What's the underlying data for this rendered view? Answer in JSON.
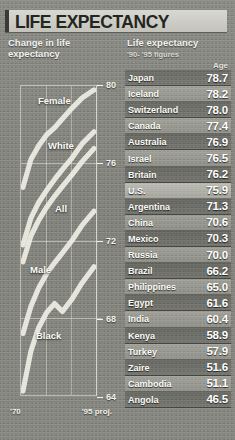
{
  "title": "LIFE EXPECTANCY",
  "panels": {
    "left_heading": "Change in life\nexpectancy",
    "right_heading": "Life expectancy",
    "right_note": "'90- '95 figures",
    "age_column_label": "Age"
  },
  "chart_data": {
    "type": "line",
    "title": "Change in life expectancy",
    "xlabel": "",
    "ylabel": "Age",
    "ylim": [
      64,
      80
    ],
    "yticks": [
      80,
      76,
      72,
      68,
      64
    ],
    "xticks": [
      "'70",
      "'95 proj."
    ],
    "xlim_labels": {
      "start": "'70",
      "end": "'95 proj."
    },
    "grid": true,
    "legend_position": "inline-labels",
    "x": [
      1970,
      1975,
      1980,
      1985,
      1990,
      1995
    ],
    "series": [
      {
        "name": "Female",
        "values": [
          74.7,
          76.6,
          77.4,
          78.2,
          78.8,
          79.7
        ]
      },
      {
        "name": "White",
        "values": [
          71.7,
          73.4,
          74.4,
          75.3,
          76.1,
          77.0
        ]
      },
      {
        "name": "All",
        "values": [
          70.8,
          72.6,
          73.7,
          74.7,
          75.4,
          76.3
        ]
      },
      {
        "name": "Male",
        "values": [
          67.1,
          68.8,
          70.0,
          71.1,
          71.8,
          72.8
        ]
      },
      {
        "name": "Black",
        "values": [
          64.1,
          66.8,
          68.1,
          69.3,
          69.1,
          70.3
        ]
      }
    ]
  },
  "table": {
    "name_header": "",
    "value_header": "Age",
    "highlight": "U.S.",
    "rows": [
      {
        "country": "Japan",
        "age": "78.7"
      },
      {
        "country": "Iceland",
        "age": "78.2"
      },
      {
        "country": "Switzerland",
        "age": "78.0"
      },
      {
        "country": "Canada",
        "age": "77.4"
      },
      {
        "country": "Australia",
        "age": "76.9"
      },
      {
        "country": "Israel",
        "age": "76.5"
      },
      {
        "country": "Britain",
        "age": "76.2"
      },
      {
        "country": "U.S.",
        "age": "75.9"
      },
      {
        "country": "Argentina",
        "age": "71.3"
      },
      {
        "country": "China",
        "age": "70.6"
      },
      {
        "country": "Mexico",
        "age": "70.3"
      },
      {
        "country": "Russia",
        "age": "70.0"
      },
      {
        "country": "Brazil",
        "age": "66.2"
      },
      {
        "country": "Philippines",
        "age": "65.0"
      },
      {
        "country": "Egypt",
        "age": "61.6"
      },
      {
        "country": "India",
        "age": "60.4"
      },
      {
        "country": "Kenya",
        "age": "58.9"
      },
      {
        "country": "Turkey",
        "age": "57.9"
      },
      {
        "country": "Zaire",
        "age": "51.6"
      },
      {
        "country": "Cambodia",
        "age": "51.1"
      },
      {
        "country": "Angola",
        "age": "46.5"
      }
    ]
  },
  "colors": {
    "background": "#8a8a86",
    "title_band": "#d0d0c9",
    "title_text": "#25251f",
    "text_light": "#fbfbf6",
    "curve": "#e8e8e0"
  }
}
